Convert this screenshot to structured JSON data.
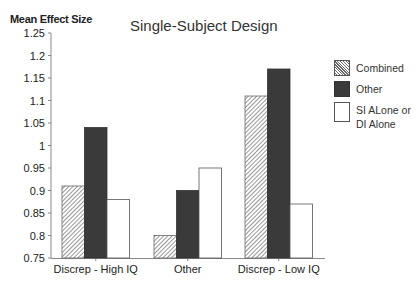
{
  "chart_data": {
    "type": "bar",
    "title": "Single-Subject Design",
    "xlabel": "",
    "ylabel": "Mean Effect Size",
    "ylim": [
      0.75,
      1.25
    ],
    "yticks": [
      "0.75",
      "0.8",
      "0.85",
      "0.9",
      "0.95",
      "1",
      "1.05",
      "1.1",
      "1.15",
      "1.2",
      "1.25"
    ],
    "grid": false,
    "legend_position": "right",
    "categories": [
      "Discrep - High IQ",
      "Other",
      "Discrep - Low IQ"
    ],
    "series": [
      {
        "name": "Combined",
        "pattern": "hatched",
        "values": [
          0.91,
          0.8,
          1.11
        ]
      },
      {
        "name": "Other",
        "pattern": "solid-dark",
        "values": [
          1.04,
          0.9,
          1.17
        ]
      },
      {
        "name": "SI ALone or DI Alone",
        "pattern": "white",
        "values": [
          0.88,
          0.95,
          0.87
        ]
      }
    ]
  },
  "legend": {
    "combined": "Combined",
    "other": "Other",
    "si_line1": "SI ALone or",
    "si_line2": "DI Alone"
  },
  "colors": {
    "other_fill": "#3a3a3a",
    "hatch_dark": "#6a6a6a",
    "axis": "#888888",
    "outline": "#555555"
  }
}
